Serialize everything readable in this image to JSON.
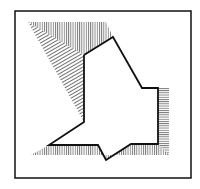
{
  "diagram": {
    "colors": {
      "background": "#ffffff",
      "stroke": "#111111",
      "hatch": "#333333"
    },
    "frame": {
      "x": 15,
      "y": 11,
      "width": 176,
      "height": 167
    },
    "outline_polyline": [
      [
        84,
        55
      ],
      [
        113,
        37
      ],
      [
        142,
        88
      ],
      [
        158,
        88
      ],
      [
        158,
        144
      ],
      [
        131,
        144
      ],
      [
        106,
        160
      ],
      [
        98,
        145
      ],
      [
        49,
        145
      ],
      [
        84,
        122
      ],
      [
        84,
        55
      ]
    ],
    "hatched_regions": [
      {
        "name": "top-vertical-hatch",
        "direction": "vertical",
        "points": [
          [
            28,
            22
          ],
          [
            106,
            22
          ],
          [
            113,
            37
          ],
          [
            84,
            55
          ]
        ]
      },
      {
        "name": "left-diagonal-hatch",
        "direction": "diagonal",
        "points": [
          [
            28,
            22
          ],
          [
            84,
            55
          ],
          [
            84,
            122
          ]
        ]
      },
      {
        "name": "right-horizontal-hatch",
        "direction": "horizontal",
        "points": [
          [
            158,
            88
          ],
          [
            169,
            88
          ],
          [
            169,
            155
          ],
          [
            158,
            144
          ]
        ]
      },
      {
        "name": "bottom-vertical-hatch",
        "direction": "vertical",
        "points": [
          [
            49,
            145
          ],
          [
            98,
            145
          ],
          [
            106,
            160
          ],
          [
            131,
            144
          ],
          [
            158,
            144
          ],
          [
            169,
            155
          ],
          [
            31,
            155
          ]
        ]
      }
    ]
  }
}
